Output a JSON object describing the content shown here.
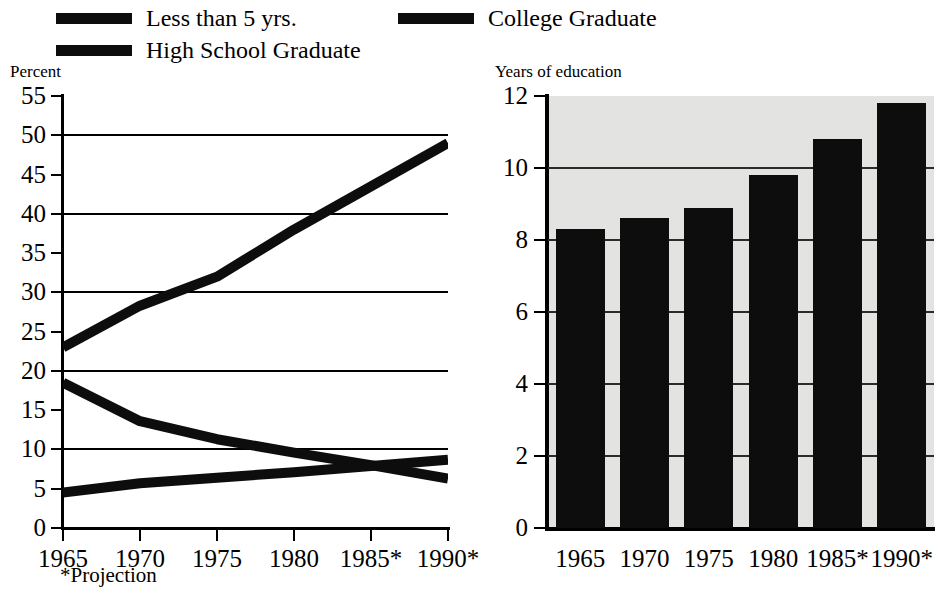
{
  "legend": {
    "items": [
      {
        "id": "less-than-5-yrs",
        "label": "Less than 5 yrs.",
        "color": "#0d0d0d"
      },
      {
        "id": "college-graduate",
        "label": "College Graduate",
        "color": "#0d0d0d"
      },
      {
        "id": "high-school-graduate",
        "label": "High School Graduate",
        "color": "#0d0d0d"
      }
    ]
  },
  "left_chart": {
    "axis_title": "Percent",
    "footnote": "*Projection",
    "y_ticks": [
      "55",
      "50",
      "45",
      "40",
      "35",
      "30",
      "25",
      "20",
      "15",
      "10",
      "5",
      "0"
    ],
    "x_ticks": [
      "1965",
      "1970",
      "1975",
      "1980",
      "1985*",
      "1990*"
    ]
  },
  "right_chart": {
    "axis_title": "Years of education",
    "y_ticks": [
      "12",
      "10",
      "8",
      "6",
      "4",
      "2",
      "0"
    ],
    "x_ticks": [
      "1965",
      "1970",
      "1975",
      "1980",
      "1985*",
      "1990*"
    ]
  },
  "chart_data": [
    {
      "type": "line",
      "title": "Educational attainment of the population",
      "xlabel": "",
      "ylabel": "Percent",
      "x": [
        "1965",
        "1970",
        "1975",
        "1980",
        "1985*",
        "1990*"
      ],
      "xlim": [
        1965,
        1990
      ],
      "ylim": [
        0,
        55
      ],
      "y_tick_step": 5,
      "gridline_values": [
        50,
        40,
        30,
        20,
        10
      ],
      "grid": true,
      "legend_position": "top",
      "annotations": [
        "*Projection"
      ],
      "series": [
        {
          "name": "College Graduate",
          "values": [
            23.0,
            28.3,
            32.0,
            38.0,
            43.5,
            49.0
          ],
          "color": "#0d0d0d"
        },
        {
          "name": "Less than 5 yrs.",
          "values": [
            18.5,
            13.6,
            11.3,
            9.6,
            8.0,
            6.3
          ],
          "color": "#0d0d0d"
        },
        {
          "name": "High School Graduate",
          "values": [
            4.5,
            5.7,
            6.4,
            7.1,
            7.9,
            8.7
          ],
          "color": "#0d0d0d"
        }
      ]
    },
    {
      "type": "bar",
      "title": "Median years of education",
      "xlabel": "",
      "ylabel": "Years of education",
      "categories": [
        "1965",
        "1970",
        "1975",
        "1980",
        "1985*",
        "1990*"
      ],
      "values": [
        8.3,
        8.6,
        8.9,
        9.8,
        10.8,
        11.8
      ],
      "ylim": [
        0,
        12
      ],
      "y_tick_step": 2,
      "gridline_values": [
        10,
        8,
        6,
        4,
        2
      ],
      "grid": true,
      "bar_color": "#0d0d0d",
      "plot_background": "#e3e3e1"
    }
  ]
}
